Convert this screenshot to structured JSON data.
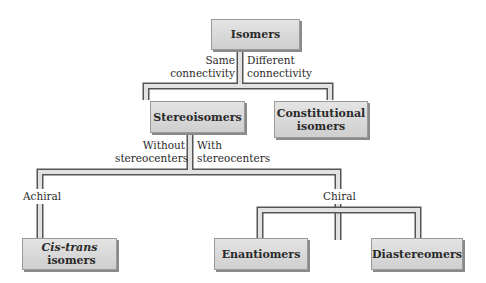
{
  "diagram": {
    "type": "tree",
    "nodes": {
      "root": {
        "label": "Isomers"
      },
      "stereoisomers": {
        "label": "Stereoisomers"
      },
      "constitutional": {
        "line1": "Constitutional",
        "line2": "isomers"
      },
      "cis_trans": {
        "italic": "Cis-trans",
        "rest": " isomers"
      },
      "enantiomers": {
        "label": "Enantiomers"
      },
      "diastereomers": {
        "label": "Diastereomers"
      }
    },
    "edges": {
      "same_connectivity": {
        "line1": "Same",
        "line2": "connectivity"
      },
      "different_connectivity": {
        "line1": "Different",
        "line2": "connectivity"
      },
      "without_stereocenters": {
        "line1": "Without",
        "line2": "stereocenters"
      },
      "with_stereocenters": {
        "line1": "With",
        "line2": "stereocenters"
      },
      "achiral": {
        "label": "Achiral"
      },
      "chiral": {
        "label": "Chiral"
      }
    },
    "colors": {
      "box_fill_top": "#e4e4e4",
      "box_fill_bottom": "#cfcfcf",
      "box_shadow": "#8a8a8a",
      "pipe_fill": "#e0e0e0",
      "pipe_outline": "#555555"
    }
  }
}
